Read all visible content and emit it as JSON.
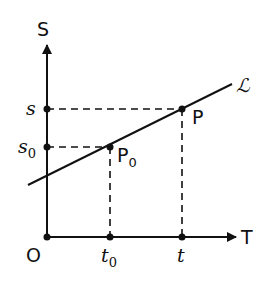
{
  "axes": {
    "y_label": "S",
    "x_label": "T",
    "origin_label": "O"
  },
  "y_ticks": [
    {
      "label": "s",
      "sub": ""
    },
    {
      "label": "s",
      "sub": "0"
    }
  ],
  "x_ticks": [
    {
      "label": "t",
      "sub": "0"
    },
    {
      "label": "t",
      "sub": ""
    }
  ],
  "points": [
    {
      "label": "P",
      "sub": "0"
    },
    {
      "label": "P",
      "sub": ""
    }
  ],
  "line_label": "ℒ"
}
